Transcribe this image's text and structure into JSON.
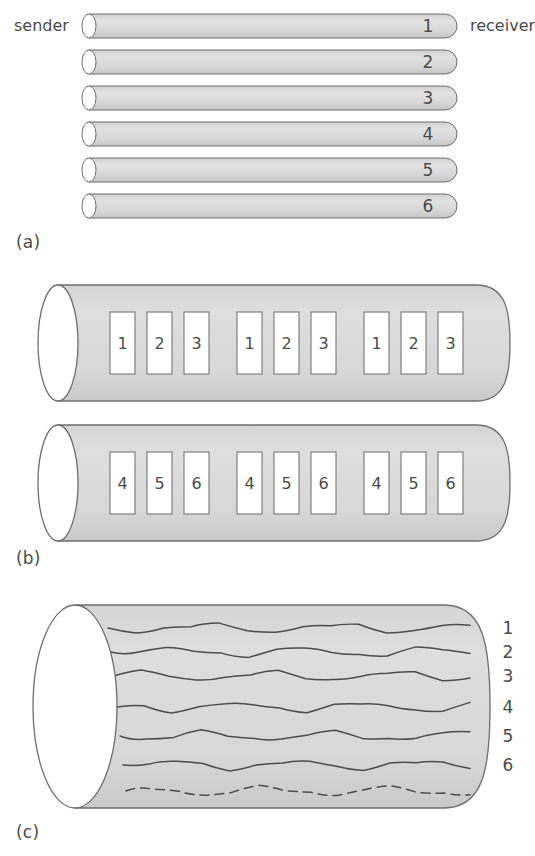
{
  "figure": {
    "endpoints": {
      "sender": "sender",
      "receiver": "receiver"
    },
    "colors": {
      "fill": "#d9d9d9",
      "stroke": "#6e6e6e",
      "text": "#4a4a4a",
      "box_fill": "#ffffff",
      "background": "#ffffff"
    },
    "parts": [
      {
        "id": "a",
        "label": "(a)",
        "kind": "thin-pipes",
        "description": "Six thin horizontal pipes each carrying one channel",
        "channels": [
          "1",
          "2",
          "3",
          "4",
          "5",
          "6"
        ],
        "pipes": [
          {
            "label": "1",
            "x": 82,
            "y": 14,
            "width": 375,
            "height": 24
          },
          {
            "label": "2",
            "x": 82,
            "y": 50,
            "width": 375,
            "height": 24
          },
          {
            "label": "3",
            "x": 82,
            "y": 86,
            "width": 375,
            "height": 24
          },
          {
            "label": "4",
            "x": 82,
            "y": 122,
            "width": 375,
            "height": 24
          },
          {
            "label": "5",
            "x": 82,
            "y": 158,
            "width": 375,
            "height": 24
          },
          {
            "label": "6",
            "x": 82,
            "y": 194,
            "width": 375,
            "height": 24
          }
        ]
      },
      {
        "id": "b",
        "label": "(b)",
        "kind": "pipes-with-slots",
        "description": "Two wide pipes carrying interleaved numbered time slots",
        "pipes": [
          {
            "name": "pipe-upper",
            "x": 38,
            "y": 285,
            "width": 472,
            "height": 116,
            "slot_groups": [
              [
                "1",
                "2",
                "3"
              ],
              [
                "1",
                "2",
                "3"
              ],
              [
                "1",
                "2",
                "3"
              ]
            ]
          },
          {
            "name": "pipe-lower",
            "x": 38,
            "y": 425,
            "width": 472,
            "height": 116,
            "slot_groups": [
              [
                "4",
                "5",
                "6"
              ],
              [
                "4",
                "5",
                "6"
              ],
              [
                "4",
                "5",
                "6"
              ]
            ]
          }
        ],
        "slot_geometry": {
          "width": 25,
          "height": 62,
          "inner_gap": 12,
          "group_gap": 28,
          "first_x": 110,
          "offset_y": 27
        }
      },
      {
        "id": "c",
        "label": "(c)",
        "kind": "pipe-with-waves",
        "description": "One wide pipe carrying six wavy signal traces plus a dashed trace",
        "pipe": {
          "x": 33,
          "y": 605,
          "width": 457,
          "height": 203
        },
        "wave_labels": [
          "1",
          "2",
          "3",
          "4",
          "5",
          "6"
        ],
        "waves": [
          {
            "label": "1",
            "y": 628,
            "style": "solid"
          },
          {
            "label": "2",
            "y": 652,
            "style": "solid"
          },
          {
            "label": "3",
            "y": 676,
            "style": "solid"
          },
          {
            "label": "4",
            "y": 707,
            "style": "solid"
          },
          {
            "label": "5",
            "y": 736,
            "style": "solid"
          },
          {
            "label": "6",
            "y": 765,
            "style": "solid"
          },
          {
            "label": "",
            "y": 791,
            "style": "dashed"
          }
        ]
      }
    ]
  }
}
